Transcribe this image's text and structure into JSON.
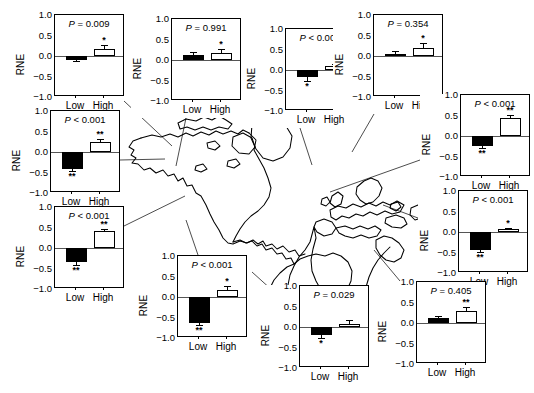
{
  "figure": {
    "title": "",
    "axis_label": "RNE",
    "x_categories": [
      "Low",
      "High"
    ],
    "y_ticks": [
      "1.0",
      "0.5",
      "0.0",
      "-0.5",
      "-1.0"
    ],
    "y_range": [
      -1.0,
      1.0
    ],
    "map_regions": [
      "North America",
      "South America",
      "Europe",
      "Africa"
    ]
  },
  "chart_data": {
    "type": "bar",
    "title": "",
    "xlabel": "",
    "ylabel": "RNE",
    "ylim": [
      -1.0,
      1.0
    ],
    "categories": [
      "Low",
      "High"
    ],
    "grid": false,
    "legend": "none",
    "yticks": [
      1.0,
      0.5,
      0.0,
      -0.5,
      -1.0
    ],
    "panels": [
      {
        "id": "panel-1",
        "p_text": "P = 0.009",
        "p_operator": "=",
        "p_value": "0.009",
        "values": [
          -0.09,
          0.16
        ],
        "errors": [
          0.04,
          0.11
        ],
        "fills": [
          "filled",
          "open"
        ],
        "significance": [
          "",
          "*"
        ]
      },
      {
        "id": "panel-2",
        "p_text": "P = 0.991",
        "p_operator": "=",
        "p_value": "0.991",
        "values": [
          0.13,
          0.17
        ],
        "errors": [
          0.06,
          0.1
        ],
        "fills": [
          "filled",
          "open"
        ],
        "significance": [
          "",
          "*"
        ]
      },
      {
        "id": "panel-3",
        "p_text": "P < 0.001",
        "p_operator": "<",
        "p_value": "0.001",
        "values": [
          -0.18,
          0.09
        ],
        "errors": [
          0.08,
          0.05
        ],
        "fills": [
          "filled",
          "open"
        ],
        "significance": [
          "*",
          "*"
        ]
      },
      {
        "id": "panel-4",
        "p_text": "P = 0.354",
        "p_operator": "=",
        "p_value": "0.354",
        "values": [
          0.06,
          0.19
        ],
        "errors": [
          0.07,
          0.12
        ],
        "fills": [
          "filled",
          "open"
        ],
        "significance": [
          "",
          "*"
        ]
      },
      {
        "id": "panel-5",
        "p_text": "P < 0.001",
        "p_operator": "<",
        "p_value": "0.001",
        "values": [
          -0.24,
          0.45
        ],
        "errors": [
          0.05,
          0.06
        ],
        "fills": [
          "filled",
          "open"
        ],
        "significance": [
          "**",
          "**"
        ]
      },
      {
        "id": "panel-6",
        "p_text": "P < 0.001",
        "p_operator": "<",
        "p_value": "0.001",
        "values": [
          -0.44,
          0.07
        ],
        "errors": [
          0.05,
          0.03
        ],
        "fills": [
          "filled",
          "open"
        ],
        "significance": [
          "**",
          "*"
        ]
      },
      {
        "id": "panel-7",
        "p_text": "P = 0.405",
        "p_operator": "=",
        "p_value": "0.405",
        "values": [
          0.11,
          0.3
        ],
        "errors": [
          0.05,
          0.08
        ],
        "fills": [
          "filled",
          "open"
        ],
        "significance": [
          "",
          "**"
        ]
      },
      {
        "id": "panel-8",
        "p_text": "P = 0.029",
        "p_operator": "=",
        "p_value": "0.029",
        "values": [
          -0.19,
          0.08
        ],
        "errors": [
          0.07,
          0.09
        ],
        "fills": [
          "filled",
          "open"
        ],
        "significance": [
          "*",
          ""
        ]
      },
      {
        "id": "panel-9",
        "p_text": "P < 0.001",
        "p_operator": "<",
        "p_value": "0.001",
        "values": [
          -0.63,
          0.18
        ],
        "errors": [
          0.06,
          0.09
        ],
        "fills": [
          "filled",
          "open"
        ],
        "significance": [
          "**",
          "*"
        ]
      },
      {
        "id": "panel-10",
        "p_text": "P < 0.001",
        "p_operator": "<",
        "p_value": "0.001",
        "values": [
          -0.42,
          0.24
        ],
        "errors": [
          0.05,
          0.08
        ],
        "fills": [
          "filled",
          "open"
        ],
        "significance": [
          "**",
          "**"
        ]
      },
      {
        "id": "panel-11",
        "p_text": "P < 0.001",
        "p_operator": "<",
        "p_value": "0.001",
        "values": [
          -0.35,
          0.41
        ],
        "errors": [
          0.06,
          0.06
        ],
        "fills": [
          "filled",
          "open"
        ],
        "significance": [
          "**",
          "**"
        ]
      }
    ]
  },
  "layout": {
    "panels": [
      {
        "id": "panel-1",
        "x": 14,
        "y": 14,
        "w": 110,
        "h": 100
      },
      {
        "id": "panel-2",
        "x": 131,
        "y": 18,
        "w": 110,
        "h": 100
      },
      {
        "id": "panel-3",
        "x": 245,
        "y": 28,
        "w": 110,
        "h": 100
      },
      {
        "id": "panel-4",
        "x": 333,
        "y": 14,
        "w": 110,
        "h": 100
      },
      {
        "id": "panel-5",
        "x": 420,
        "y": 94,
        "w": 110,
        "h": 100
      },
      {
        "id": "panel-6",
        "x": 418,
        "y": 190,
        "w": 110,
        "h": 100
      },
      {
        "id": "panel-7",
        "x": 376,
        "y": 281,
        "w": 110,
        "h": 100
      },
      {
        "id": "panel-8",
        "x": 259,
        "y": 285,
        "w": 110,
        "h": 100
      },
      {
        "id": "panel-9",
        "x": 137,
        "y": 255,
        "w": 110,
        "h": 100
      },
      {
        "id": "panel-10",
        "x": 10,
        "y": 110,
        "w": 110,
        "h": 100
      },
      {
        "id": "panel-11",
        "x": 14,
        "y": 206,
        "w": 110,
        "h": 100
      }
    ]
  }
}
